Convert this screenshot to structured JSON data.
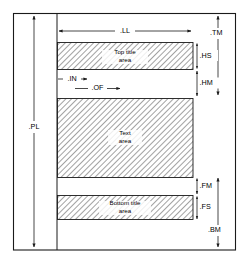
{
  "diagram": {
    "background_color": "#ffffff",
    "line_color": "#1a1a1a",
    "hatch_color": "#808080",
    "blocks": [
      {
        "id": "top-title",
        "label_line1": "Top title",
        "label_line2": "area"
      },
      {
        "id": "text",
        "label_line1": "Text",
        "label_line2": "area"
      },
      {
        "id": "bottom-title",
        "label_line1": "Bottom title",
        "label_line2": "area"
      }
    ],
    "dimensions": [
      {
        "id": "pl",
        "label": ".PL",
        "orientation": "vertical",
        "side": "left"
      },
      {
        "id": "ll",
        "label": ".LL",
        "orientation": "horizontal",
        "side": "top"
      },
      {
        "id": "tm",
        "label": ".TM",
        "orientation": "vertical",
        "side": "right"
      },
      {
        "id": "hs",
        "label": ".HS",
        "orientation": "vertical",
        "side": "right"
      },
      {
        "id": "hm",
        "label": ".HM",
        "orientation": "vertical",
        "side": "right"
      },
      {
        "id": "in",
        "label": ".IN",
        "orientation": "horizontal",
        "side": "inner"
      },
      {
        "id": "of",
        "label": ".OF",
        "orientation": "horizontal",
        "side": "inner"
      },
      {
        "id": "fm",
        "label": ".FM",
        "orientation": "vertical",
        "side": "right"
      },
      {
        "id": "fs",
        "label": ".FS",
        "orientation": "vertical",
        "side": "right"
      },
      {
        "id": "bm",
        "label": ".BM",
        "orientation": "vertical",
        "side": "right"
      }
    ]
  }
}
